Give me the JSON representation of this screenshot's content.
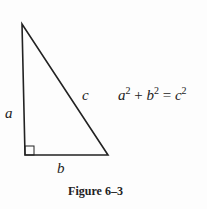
{
  "figure": {
    "caption": "Figure 6–3",
    "labels": {
      "a": "a",
      "b": "b",
      "c": "c"
    },
    "equation": {
      "term1": "a",
      "exp1": "2",
      "plus": " + ",
      "term2": "b",
      "exp2": "2",
      "equals": " = ",
      "term3": "c",
      "exp3": "2"
    },
    "triangle": {
      "vertices": [
        [
          22,
          24
        ],
        [
          25,
          155
        ],
        [
          108,
          155
        ]
      ],
      "right_angle_at": "bottom-left",
      "stroke": "#222222"
    }
  }
}
